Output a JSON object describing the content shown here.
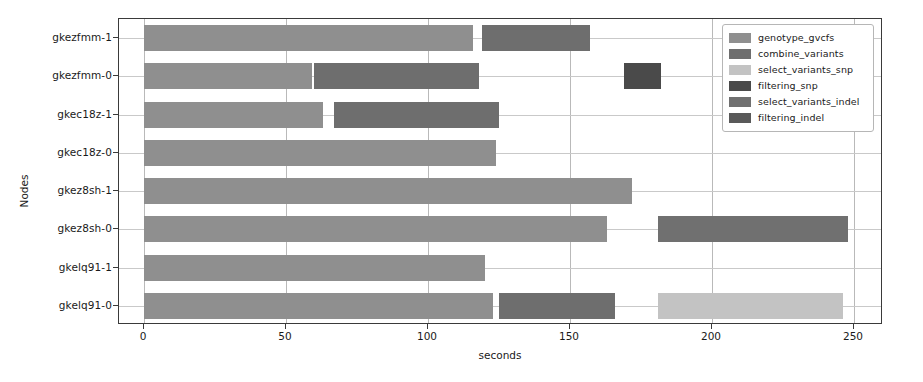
{
  "chart_data": {
    "type": "bar",
    "orientation": "horizontal",
    "subtype": "gantt-broken-barh",
    "title": "",
    "xlabel": "seconds",
    "ylabel": "Nodes",
    "xlim": [
      -5,
      264
    ],
    "xticks": [
      0,
      50,
      100,
      150,
      200,
      250
    ],
    "xtick_labels": [
      "0",
      "50",
      "100",
      "150",
      "200",
      "250"
    ],
    "grid": true,
    "legend_position": "upper right",
    "categories": [
      "gkezfmm-1",
      "gkezfmm-0",
      "gkec18z-1",
      "gkec18z-0",
      "gkez8sh-1",
      "gkez8sh-0",
      "gkelq91-1",
      "gkelq91-0"
    ],
    "colors": {
      "genotype_gvcfs": "#8f8f8f",
      "combine_variants": "#6e6e6e",
      "select_variants_snp": "#c3c3c3",
      "filtering_snp": "#4a4a4a",
      "select_variants_indel": "#707070",
      "filtering_indel": "#595959"
    },
    "series": [
      {
        "name": "genotype_gvcfs",
        "label": "genotype_gvcfs"
      },
      {
        "name": "combine_variants",
        "label": "combine_variants"
      },
      {
        "name": "select_variants_snp",
        "label": "select_variants_snp"
      },
      {
        "name": "filtering_snp",
        "label": "filtering_snp"
      },
      {
        "name": "select_variants_indel",
        "label": "select_variants_indel"
      },
      {
        "name": "filtering_indel",
        "label": "filtering_indel"
      }
    ],
    "bars": [
      {
        "node": "gkezfmm-1",
        "row": 0,
        "segments": [
          {
            "task": "genotype_gvcfs",
            "start": 0,
            "end": 116
          },
          {
            "task": "combine_variants",
            "start": 119,
            "end": 157
          }
        ]
      },
      {
        "node": "gkezfmm-0",
        "row": 1,
        "segments": [
          {
            "task": "genotype_gvcfs",
            "start": 0,
            "end": 59
          },
          {
            "task": "combine_variants",
            "start": 60,
            "end": 118
          },
          {
            "task": "filtering_snp",
            "start": 169,
            "end": 182
          }
        ]
      },
      {
        "node": "gkec18z-1",
        "row": 2,
        "segments": [
          {
            "task": "genotype_gvcfs",
            "start": 0,
            "end": 63
          },
          {
            "task": "combine_variants",
            "start": 67,
            "end": 125
          }
        ]
      },
      {
        "node": "gkec18z-0",
        "row": 3,
        "segments": [
          {
            "task": "genotype_gvcfs",
            "start": 0,
            "end": 124
          }
        ]
      },
      {
        "node": "gkez8sh-1",
        "row": 4,
        "segments": [
          {
            "task": "genotype_gvcfs",
            "start": 0,
            "end": 172
          }
        ]
      },
      {
        "node": "gkez8sh-0",
        "row": 5,
        "segments": [
          {
            "task": "genotype_gvcfs",
            "start": 0,
            "end": 163
          },
          {
            "task": "select_variants_indel",
            "start": 181,
            "end": 248
          }
        ]
      },
      {
        "node": "gkelq91-1",
        "row": 6,
        "segments": [
          {
            "task": "genotype_gvcfs",
            "start": 0,
            "end": 120
          }
        ]
      },
      {
        "node": "gkelq91-0",
        "row": 7,
        "segments": [
          {
            "task": "genotype_gvcfs",
            "start": 0,
            "end": 123
          },
          {
            "task": "combine_variants",
            "start": 125,
            "end": 166
          },
          {
            "task": "select_variants_snp",
            "start": 181,
            "end": 246
          }
        ]
      }
    ]
  },
  "axes": {
    "ylabel": "Nodes",
    "xlabel": "seconds"
  },
  "legend": {
    "items": [
      {
        "label": "genotype_gvcfs",
        "color": "#8f8f8f"
      },
      {
        "label": "combine_variants",
        "color": "#6e6e6e"
      },
      {
        "label": "select_variants_snp",
        "color": "#c3c3c3"
      },
      {
        "label": "filtering_snp",
        "color": "#4a4a4a"
      },
      {
        "label": "select_variants_indel",
        "color": "#707070"
      },
      {
        "label": "filtering_indel",
        "color": "#595959"
      }
    ]
  }
}
